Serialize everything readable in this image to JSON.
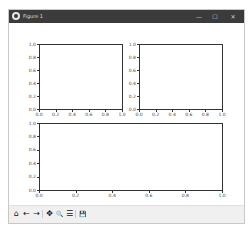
{
  "window": {
    "title": "Figure 1",
    "controls": {
      "minimize": "—",
      "maximize": "☐",
      "close": "✕"
    }
  },
  "toolbar": {
    "items": [
      {
        "name": "home",
        "glyph": "⌂"
      },
      {
        "name": "back",
        "glyph": "←"
      },
      {
        "name": "forward",
        "glyph": "→"
      },
      {
        "name": "pan",
        "glyph": "✥"
      },
      {
        "name": "zoom",
        "glyph": "🔍"
      },
      {
        "name": "configure-subplots",
        "glyph": "☰"
      },
      {
        "name": "save",
        "glyph": "💾"
      }
    ]
  },
  "chart_data": [
    {
      "type": "line",
      "title": "",
      "xlabel": "",
      "ylabel": "",
      "xlim": [
        0.0,
        1.0
      ],
      "ylim": [
        0.0,
        1.0
      ],
      "xticks": [
        "0.0",
        "0.2",
        "0.4",
        "0.6",
        "0.8",
        "1.0"
      ],
      "yticks": [
        "0.0",
        "0.2",
        "0.4",
        "0.6",
        "0.8",
        "1.0"
      ],
      "series": [],
      "position": "top-left"
    },
    {
      "type": "line",
      "title": "",
      "xlabel": "",
      "ylabel": "",
      "xlim": [
        0.0,
        1.0
      ],
      "ylim": [
        0.0,
        1.0
      ],
      "xticks": [
        "0.0",
        "0.2",
        "0.4",
        "0.6",
        "0.8",
        "1.0"
      ],
      "yticks": [
        "0.0",
        "0.2",
        "0.4",
        "0.6",
        "0.8",
        "1.0"
      ],
      "series": [],
      "position": "top-right"
    },
    {
      "type": "line",
      "title": "",
      "xlabel": "",
      "ylabel": "",
      "xlim": [
        0.0,
        1.0
      ],
      "ylim": [
        0.0,
        1.0
      ],
      "xticks": [
        "0.0",
        "0.2",
        "0.4",
        "0.6",
        "0.8",
        "1.0"
      ],
      "yticks": [
        "0.0",
        "0.2",
        "0.4",
        "0.6",
        "0.8",
        "1.0"
      ],
      "series": [],
      "position": "bottom-wide"
    }
  ]
}
